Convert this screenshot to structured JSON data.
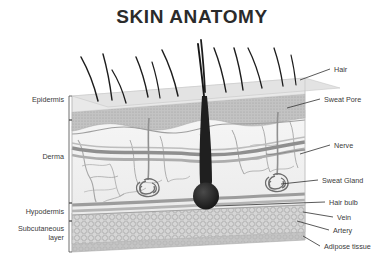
{
  "title": "SKIN ANATOMY",
  "diagram": {
    "type": "anatomical-cross-section",
    "view": "3d-block-cutaway"
  },
  "colors": {
    "title": "#2b2b2b",
    "label": "#3a3a3a",
    "leader": "#3c3c3c",
    "bracket": "#4a4a4a",
    "epidermis_top": "#e8e8e8",
    "epidermis_band": "#b9b9b9",
    "dermis": "#f3f3f3",
    "vessel": "#9a9a9a",
    "hypodermis": "#cfcfcf",
    "adipose": "#d2d2d2",
    "adipose_side": "#bdbdbd",
    "hair": "#1d1d1d",
    "gland": "#6e6e6e"
  },
  "left_labels": [
    {
      "id": "epidermis",
      "text": "Epidermis",
      "x": 64,
      "y": 100,
      "bracket_top": 96,
      "bracket_bottom": 120
    },
    {
      "id": "derma",
      "text": "Derma",
      "x": 64,
      "y": 157,
      "bracket_top": 120,
      "bracket_bottom": 203
    },
    {
      "id": "hypodermis",
      "text": "Hypodermis",
      "x": 64,
      "y": 212,
      "bracket_top": 203,
      "bracket_bottom": 221
    },
    {
      "id": "subcutaneous",
      "text": "Subcutaneous",
      "x": 64,
      "y": 229,
      "bracket_top": 221,
      "bracket_bottom": 252
    },
    {
      "id": "subcutaneous_line2",
      "text": "layer",
      "x": 64,
      "y": 238
    }
  ],
  "right_labels": [
    {
      "id": "hair",
      "text": "Hair",
      "x": 334,
      "y": 70,
      "lx1": 300,
      "ly1": 80,
      "lx2": 330,
      "ly2": 69
    },
    {
      "id": "sweat-pore",
      "text": "Sweat Pore",
      "x": 324,
      "y": 100,
      "lx1": 287,
      "ly1": 108,
      "lx2": 320,
      "ly2": 99
    },
    {
      "id": "nerve",
      "text": "Nerve",
      "x": 334,
      "y": 146,
      "lx1": 300,
      "ly1": 154,
      "lx2": 330,
      "ly2": 145
    },
    {
      "id": "sweat-gland",
      "text": "Sweat Gland",
      "x": 322,
      "y": 181,
      "lx1": 281,
      "ly1": 184,
      "lx2": 318,
      "ly2": 180
    },
    {
      "id": "hair-bulb",
      "text": "Hair bulb",
      "x": 329,
      "y": 203,
      "lx1": 215,
      "ly1": 206,
      "lx2": 325,
      "ly2": 202
    },
    {
      "id": "vein",
      "text": "Vein",
      "x": 337,
      "y": 218,
      "lx1": 303,
      "ly1": 212,
      "lx2": 333,
      "ly2": 217
    },
    {
      "id": "artery",
      "text": "Artery",
      "x": 333,
      "y": 231,
      "lx1": 297,
      "ly1": 221,
      "lx2": 329,
      "ly2": 230
    },
    {
      "id": "adipose-tissue",
      "text": "Adipose tissue",
      "x": 324,
      "y": 247,
      "lx1": 303,
      "ly1": 236,
      "lx2": 320,
      "ly2": 246
    }
  ],
  "hairs": [
    {
      "x": 98,
      "y": 101,
      "dx": -17,
      "dy": -44,
      "w": 1.5
    },
    {
      "x": 112,
      "y": 100,
      "dx": -9,
      "dy": -46,
      "w": 1.4
    },
    {
      "x": 126,
      "y": 103,
      "dx": -14,
      "dy": -33,
      "w": 1.3
    },
    {
      "x": 148,
      "y": 97,
      "dx": -12,
      "dy": -40,
      "w": 1.4
    },
    {
      "x": 160,
      "y": 98,
      "dx": -8,
      "dy": -36,
      "w": 1.2
    },
    {
      "x": 178,
      "y": 96,
      "dx": -16,
      "dy": -46,
      "w": 1.5
    },
    {
      "x": 205,
      "y": 92,
      "dx": -4,
      "dy": -52,
      "w": 1.8
    },
    {
      "x": 226,
      "y": 92,
      "dx": -12,
      "dy": -44,
      "w": 1.4
    },
    {
      "x": 243,
      "y": 90,
      "dx": -9,
      "dy": -42,
      "w": 1.4
    },
    {
      "x": 262,
      "y": 88,
      "dx": -14,
      "dy": -40,
      "w": 1.3
    },
    {
      "x": 283,
      "y": 86,
      "dx": -9,
      "dy": -38,
      "w": 1.3
    },
    {
      "x": 296,
      "y": 85,
      "dx": -5,
      "dy": -30,
      "w": 1.1
    }
  ],
  "glands": [
    {
      "id": "sweat-gland-left",
      "cx": 148,
      "cy": 186,
      "duct_top": 122
    },
    {
      "id": "sweat-gland-right",
      "cx": 277,
      "cy": 181,
      "duct_top": 116
    }
  ]
}
